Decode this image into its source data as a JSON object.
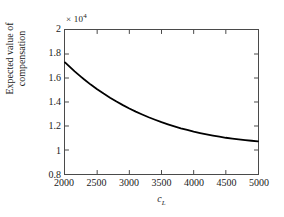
{
  "chart_data": {
    "type": "line",
    "title": "",
    "xlabel": "c_L",
    "xlabel_var": "c",
    "xlabel_sub": "L",
    "ylabel_line1": "Expected value of",
    "ylabel_line2": "compensation",
    "y_exponent_text": "× 10",
    "y_exponent_power": "4",
    "y_scale": 10000,
    "xlim": [
      2000,
      5000
    ],
    "ylim": [
      0.8,
      2.0
    ],
    "xticks": [
      2000,
      2500,
      3000,
      3500,
      4000,
      4500,
      5000
    ],
    "xtick_labels": [
      "2000",
      "2500",
      "3000",
      "3500",
      "4000",
      "4500",
      "5000"
    ],
    "yticks": [
      0.8,
      1.0,
      1.2,
      1.4,
      1.6,
      1.8,
      2.0
    ],
    "ytick_labels": [
      "0.8",
      "1",
      "1.2",
      "1.4",
      "1.6",
      "1.8",
      "2"
    ],
    "grid": false,
    "legend": null,
    "line_color": "#000000",
    "line_width": 1.8,
    "axis_color": "#4a4a4a",
    "background": "#ffffff",
    "series": [
      {
        "name": "Expected value of compensation",
        "x": [
          2000,
          2050,
          2100,
          2150,
          2200,
          2250,
          2300,
          2400,
          2500,
          2600,
          2700,
          2800,
          2900,
          3000,
          3100,
          3200,
          3300,
          3400,
          3500,
          3600,
          3700,
          3800,
          3900,
          4000,
          4100,
          4200,
          4300,
          4400,
          4500,
          4600,
          4700,
          4800,
          4900,
          5000
        ],
        "y": [
          1.73,
          1.705,
          1.68,
          1.655,
          1.632,
          1.609,
          1.587,
          1.545,
          1.506,
          1.47,
          1.436,
          1.404,
          1.374,
          1.346,
          1.32,
          1.296,
          1.273,
          1.252,
          1.232,
          1.214,
          1.197,
          1.181,
          1.167,
          1.153,
          1.141,
          1.13,
          1.12,
          1.111,
          1.102,
          1.095,
          1.088,
          1.082,
          1.077,
          1.072
        ]
      }
    ]
  }
}
